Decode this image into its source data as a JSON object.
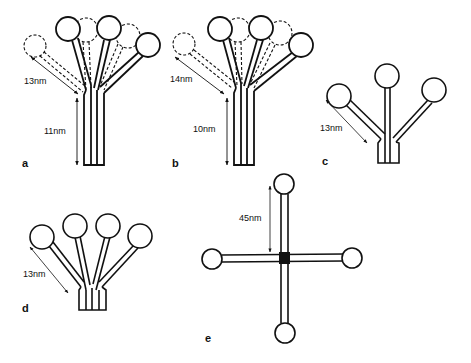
{
  "figure": {
    "panels": [
      {
        "id": "a",
        "label": "a",
        "arm_length": "13nm",
        "stem_length": "11nm",
        "arms": 3,
        "shows_flexibility": true
      },
      {
        "id": "b",
        "label": "b",
        "arm_length": "14nm",
        "stem_length": "10nm",
        "arms": 3,
        "shows_flexibility": true
      },
      {
        "id": "c",
        "label": "c",
        "arm_length": "13nm",
        "arms": 3
      },
      {
        "id": "d",
        "label": "d",
        "arm_length": "13nm",
        "arms": 4
      },
      {
        "id": "e",
        "label": "e",
        "arm_length": "45nm",
        "arms": 4,
        "shape": "cross"
      }
    ]
  },
  "colors": {
    "line": "#111111",
    "background": "#ffffff"
  }
}
